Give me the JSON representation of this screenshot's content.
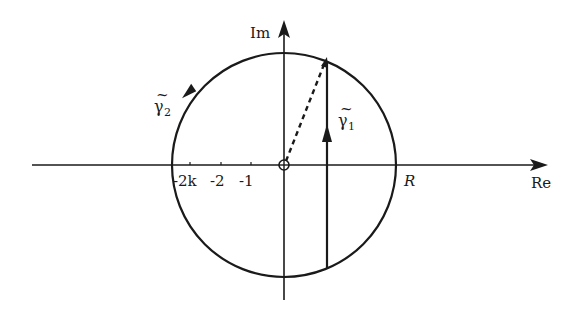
{
  "diagram": {
    "type": "complex-plane contour",
    "axes": {
      "real_label": "Re",
      "imag_label": "Im"
    },
    "tick_labels": [
      "-2k",
      "-2",
      "-1"
    ],
    "radius_label": "R",
    "contours": {
      "gamma1": {
        "symbol": "γ",
        "tilde": "~",
        "subscript": "1",
        "description": "vertical segment, upward"
      },
      "gamma2": {
        "symbol": "γ",
        "tilde": "~",
        "subscript": "2",
        "description": "circular arc, counterclockwise"
      }
    },
    "origin_marker": "circled-plus",
    "colors": {
      "ink": "#1a1a1a",
      "background": "#ffffff"
    }
  }
}
